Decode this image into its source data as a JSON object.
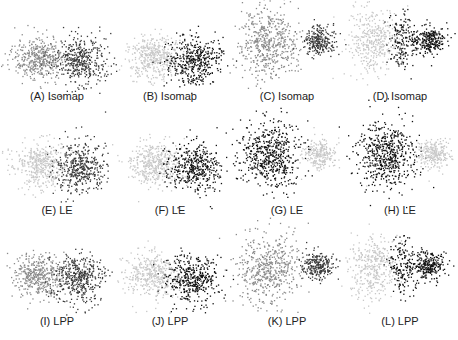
{
  "chart_data": {
    "type": "scatter",
    "title": "",
    "grid": false,
    "legend": null,
    "colors": {
      "light": "#c8c8c8",
      "mid": "#8a8a8a",
      "dark": "#3a3a3a",
      "black": "#111111"
    },
    "panels": [
      {
        "id": "A",
        "label": "(A)  Isomap",
        "row": 0,
        "col": 0,
        "x": 0,
        "y": 22,
        "w": 114,
        "h": 65,
        "cap_x": 57,
        "cap_y": 90,
        "clusters": [
          {
            "cx": 38,
            "cy": 35,
            "sx": 13,
            "sy": 11,
            "n": 420,
            "color": "mid"
          },
          {
            "cx": 80,
            "cy": 38,
            "sx": 13,
            "sy": 12,
            "n": 420,
            "color": "dark"
          }
        ]
      },
      {
        "id": "B",
        "label": "(B)  Isomap",
        "row": 0,
        "col": 1,
        "x": 114,
        "y": 22,
        "w": 114,
        "h": 65,
        "cap_x": 170,
        "cap_y": 90,
        "clusters": [
          {
            "cx": 38,
            "cy": 35,
            "sx": 13,
            "sy": 11,
            "n": 420,
            "color": "light"
          },
          {
            "cx": 80,
            "cy": 38,
            "sx": 13,
            "sy": 12,
            "n": 420,
            "color": "black"
          }
        ]
      },
      {
        "id": "C",
        "label": "(C)  Isomap",
        "row": 0,
        "col": 2,
        "x": 228,
        "y": 0,
        "w": 115,
        "h": 87,
        "cap_x": 287,
        "cap_y": 90,
        "clusters": [
          {
            "cx": 40,
            "cy": 42,
            "sx": 15,
            "sy": 17,
            "n": 520,
            "color": "mid"
          },
          {
            "cx": 90,
            "cy": 40,
            "sx": 8,
            "sy": 7,
            "n": 260,
            "color": "dark"
          }
        ]
      },
      {
        "id": "D",
        "label": "(D)  Isomap",
        "row": 0,
        "col": 3,
        "x": 343,
        "y": 0,
        "w": 115,
        "h": 87,
        "cap_x": 400,
        "cap_y": 90,
        "clusters": [
          {
            "cx": 30,
            "cy": 42,
            "sx": 12,
            "sy": 17,
            "n": 380,
            "color": "light"
          },
          {
            "cx": 58,
            "cy": 40,
            "sx": 6,
            "sy": 14,
            "n": 160,
            "color": "black"
          },
          {
            "cx": 85,
            "cy": 40,
            "sx": 8,
            "sy": 7,
            "n": 260,
            "color": "black"
          }
        ]
      },
      {
        "id": "E",
        "label": "(E)  LE",
        "row": 1,
        "col": 0,
        "x": 0,
        "y": 134,
        "w": 114,
        "h": 65,
        "cap_x": 57,
        "cap_y": 204,
        "clusters": [
          {
            "cx": 40,
            "cy": 30,
            "sx": 13,
            "sy": 11,
            "n": 420,
            "color": "light"
          },
          {
            "cx": 80,
            "cy": 33,
            "sx": 13,
            "sy": 12,
            "n": 420,
            "color": "dark"
          }
        ]
      },
      {
        "id": "F",
        "label": "(F)  LE",
        "row": 1,
        "col": 1,
        "x": 114,
        "y": 134,
        "w": 114,
        "h": 65,
        "cap_x": 170,
        "cap_y": 204,
        "clusters": [
          {
            "cx": 40,
            "cy": 30,
            "sx": 13,
            "sy": 11,
            "n": 420,
            "color": "light"
          },
          {
            "cx": 80,
            "cy": 33,
            "sx": 13,
            "sy": 12,
            "n": 420,
            "color": "black"
          }
        ]
      },
      {
        "id": "G",
        "label": "(G)  LE",
        "row": 1,
        "col": 2,
        "x": 228,
        "y": 114,
        "w": 115,
        "h": 87,
        "cap_x": 287,
        "cap_y": 204,
        "clusters": [
          {
            "cx": 42,
            "cy": 40,
            "sx": 15,
            "sy": 16,
            "n": 560,
            "color": "black"
          },
          {
            "cx": 90,
            "cy": 40,
            "sx": 8,
            "sy": 7,
            "n": 240,
            "color": "light"
          }
        ]
      },
      {
        "id": "H",
        "label": "(H)  LE",
        "row": 1,
        "col": 3,
        "x": 343,
        "y": 114,
        "w": 115,
        "h": 87,
        "cap_x": 400,
        "cap_y": 204,
        "clusters": [
          {
            "cx": 42,
            "cy": 40,
            "sx": 15,
            "sy": 16,
            "n": 560,
            "color": "black"
          },
          {
            "cx": 90,
            "cy": 40,
            "sx": 8,
            "sy": 7,
            "n": 240,
            "color": "light"
          }
        ]
      },
      {
        "id": "I",
        "label": "(I)  LPP",
        "row": 2,
        "col": 0,
        "x": 0,
        "y": 245,
        "w": 114,
        "h": 65,
        "cap_x": 57,
        "cap_y": 315,
        "clusters": [
          {
            "cx": 38,
            "cy": 30,
            "sx": 13,
            "sy": 11,
            "n": 420,
            "color": "mid"
          },
          {
            "cx": 78,
            "cy": 33,
            "sx": 13,
            "sy": 12,
            "n": 420,
            "color": "dark"
          }
        ]
      },
      {
        "id": "J",
        "label": "(J)  LPP",
        "row": 2,
        "col": 1,
        "x": 114,
        "y": 245,
        "w": 114,
        "h": 65,
        "cap_x": 170,
        "cap_y": 315,
        "clusters": [
          {
            "cx": 38,
            "cy": 30,
            "sx": 13,
            "sy": 11,
            "n": 420,
            "color": "light"
          },
          {
            "cx": 78,
            "cy": 33,
            "sx": 13,
            "sy": 12,
            "n": 420,
            "color": "black"
          }
        ]
      },
      {
        "id": "K",
        "label": "(K)  LPP",
        "row": 2,
        "col": 2,
        "x": 228,
        "y": 225,
        "w": 115,
        "h": 87,
        "cap_x": 287,
        "cap_y": 315,
        "clusters": [
          {
            "cx": 40,
            "cy": 42,
            "sx": 15,
            "sy": 17,
            "n": 520,
            "color": "mid"
          },
          {
            "cx": 90,
            "cy": 40,
            "sx": 8,
            "sy": 7,
            "n": 260,
            "color": "dark"
          }
        ]
      },
      {
        "id": "L",
        "label": "(L)  LPP",
        "row": 2,
        "col": 3,
        "x": 343,
        "y": 225,
        "w": 115,
        "h": 87,
        "cap_x": 400,
        "cap_y": 315,
        "clusters": [
          {
            "cx": 30,
            "cy": 42,
            "sx": 12,
            "sy": 17,
            "n": 380,
            "color": "light"
          },
          {
            "cx": 58,
            "cy": 40,
            "sx": 6,
            "sy": 14,
            "n": 160,
            "color": "black"
          },
          {
            "cx": 85,
            "cy": 40,
            "sx": 8,
            "sy": 7,
            "n": 260,
            "color": "black"
          }
        ]
      }
    ],
    "methods": [
      "Isomap",
      "LE",
      "LPP"
    ],
    "xlabel": "",
    "ylabel": ""
  }
}
